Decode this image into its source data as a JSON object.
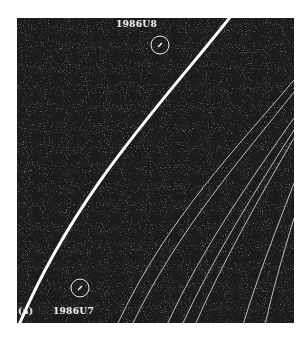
{
  "figure": {
    "panel_label": "(a)",
    "objects": [
      {
        "name": "1986U8",
        "label": "1986U8"
      },
      {
        "name": "1986U7",
        "label": "1986U7"
      }
    ],
    "colors": {
      "background": "#1a1a1a",
      "rings": "#ffffff",
      "page": "#ffffff"
    }
  }
}
